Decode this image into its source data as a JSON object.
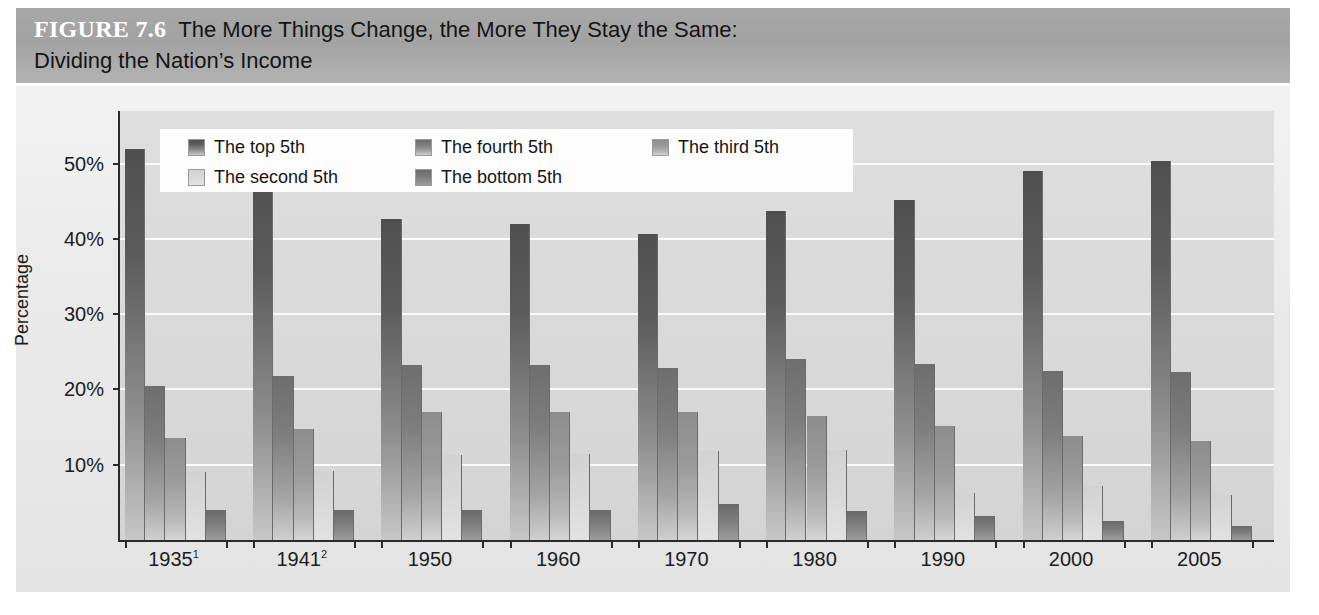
{
  "figure": {
    "number_label": "FIGURE 7.6",
    "title_line1": "The More Things Change, the More They Stay the Same:",
    "title_line2": "Dividing the Nation’s Income"
  },
  "legend": {
    "items": [
      {
        "label": "The top 5th",
        "color": "#5c5c5c"
      },
      {
        "label": "The fourth 5th",
        "color": "#7d7d7d"
      },
      {
        "label": "The third 5th",
        "color": "#9a9a9a"
      },
      {
        "label": "The second 5th",
        "color": "#d8d8d8"
      },
      {
        "label": "The bottom 5th",
        "color": "#7a7a7a"
      }
    ]
  },
  "axis": {
    "y_title": "Percentage",
    "y_ticks": [
      "10%",
      "20%",
      "30%",
      "40%",
      "50%"
    ],
    "x_ticklabels": [
      {
        "year": "1935",
        "note": "1"
      },
      {
        "year": "1941",
        "note": "2"
      },
      {
        "year": "1950",
        "note": ""
      },
      {
        "year": "1960",
        "note": ""
      },
      {
        "year": "1970",
        "note": ""
      },
      {
        "year": "1980",
        "note": ""
      },
      {
        "year": "1990",
        "note": ""
      },
      {
        "year": "2000",
        "note": ""
      },
      {
        "year": "2005",
        "note": ""
      }
    ]
  },
  "chart_data": {
    "type": "bar",
    "title": "The More Things Change, the More They Stay the Same: Dividing the Nation’s Income",
    "xlabel": "",
    "ylabel": "Percentage",
    "ylim": [
      0,
      57
    ],
    "yticks": [
      10,
      20,
      30,
      40,
      50
    ],
    "grid": true,
    "legend_position": "top-left-inside",
    "categories": [
      "1935",
      "1941",
      "1950",
      "1960",
      "1970",
      "1980",
      "1990",
      "2000",
      "2005"
    ],
    "series": [
      {
        "name": "The top 5th",
        "color": "#5c5c5c",
        "values": [
          52.0,
          49.0,
          42.7,
          42.0,
          40.7,
          43.7,
          45.2,
          49.0,
          50.4
        ]
      },
      {
        "name": "The fourth 5th",
        "color": "#7d7d7d",
        "values": [
          20.5,
          21.8,
          23.2,
          23.2,
          22.8,
          24.0,
          23.4,
          22.5,
          22.3
        ]
      },
      {
        "name": "The third 5th",
        "color": "#9a9a9a",
        "values": [
          13.5,
          14.8,
          17.0,
          17.0,
          17.0,
          16.5,
          15.2,
          13.8,
          13.2
        ]
      },
      {
        "name": "The second 5th",
        "color": "#d8d8d8",
        "values": [
          9.0,
          9.2,
          11.3,
          11.4,
          11.8,
          12.0,
          6.2,
          7.2,
          6.0
        ]
      },
      {
        "name": "The bottom 5th",
        "color": "#7a7a7a",
        "values": [
          4.0,
          4.0,
          4.0,
          4.0,
          4.8,
          3.8,
          3.2,
          2.5,
          1.8
        ]
      }
    ]
  }
}
